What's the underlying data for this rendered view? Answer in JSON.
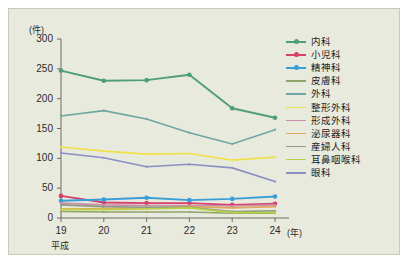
{
  "chart_data": {
    "type": "line",
    "title": "",
    "subtitle": "",
    "xlabel": "(年)",
    "ylabel": "(件)",
    "era_label": "平成",
    "x_unit": "(年)",
    "y_unit": "(件)",
    "categories": [
      "19",
      "20",
      "21",
      "22",
      "23",
      "24"
    ],
    "x": [
      19,
      20,
      21,
      22,
      23,
      24
    ],
    "xlim": [
      19,
      24
    ],
    "ylim": [
      0,
      300
    ],
    "yticks": [
      0,
      50,
      100,
      150,
      200,
      250,
      300
    ],
    "xticks": [
      "19",
      "20",
      "21",
      "22",
      "23",
      "24"
    ],
    "grid": false,
    "legend_position": "right",
    "markers": true,
    "series": [
      {
        "name": "内科",
        "color": "#4f9e78",
        "marker": true,
        "values": [
          247,
          230,
          231,
          240,
          184,
          168
        ]
      },
      {
        "name": "小児科",
        "color": "#d4426c",
        "marker": true,
        "values": [
          37,
          26,
          25,
          25,
          22,
          24
        ]
      },
      {
        "name": "精神科",
        "color": "#3a9ed6",
        "marker": true,
        "values": [
          29,
          31,
          34,
          30,
          32,
          36
        ]
      },
      {
        "name": "皮膚科",
        "color": "#92a36b",
        "marker": false,
        "values": [
          11,
          10,
          10,
          10,
          8,
          8
        ]
      },
      {
        "name": "外科",
        "color": "#6fa6a1",
        "marker": false,
        "values": [
          171,
          180,
          166,
          143,
          124,
          148
        ]
      },
      {
        "name": "整形外科",
        "color": "#f2e04a",
        "marker": false,
        "values": [
          119,
          112,
          107,
          108,
          97,
          102
        ]
      },
      {
        "name": "形成外科",
        "color": "#c78fa8",
        "marker": false,
        "values": [
          25,
          22,
          21,
          21,
          20,
          22
        ]
      },
      {
        "name": "泌尿器科",
        "color": "#e0a85c",
        "marker": false,
        "values": [
          15,
          16,
          17,
          19,
          17,
          19
        ]
      },
      {
        "name": "産婦人科",
        "color": "#8f9a86",
        "marker": false,
        "values": [
          22,
          19,
          18,
          18,
          11,
          12
        ]
      },
      {
        "name": "耳鼻咽喉科",
        "color": "#b7d34a",
        "marker": false,
        "values": [
          14,
          14,
          15,
          17,
          9,
          9
        ]
      },
      {
        "name": "眼科",
        "color": "#8b8fc4",
        "marker": false,
        "values": [
          109,
          101,
          86,
          90,
          84,
          61
        ]
      }
    ]
  },
  "legend": {
    "items": [
      {
        "label": "内科"
      },
      {
        "label": "小児科"
      },
      {
        "label": "精神科"
      },
      {
        "label": "皮膚科"
      },
      {
        "label": "外科"
      },
      {
        "label": "整形外科"
      },
      {
        "label": "形成外科"
      },
      {
        "label": "泌尿器科"
      },
      {
        "label": "産婦人科"
      },
      {
        "label": "耳鼻咽喉科"
      },
      {
        "label": "眼科"
      }
    ]
  },
  "axes": {
    "y_unit": "(件)",
    "x_unit": "(年)",
    "era": "平成",
    "yticks": [
      "300",
      "250",
      "200",
      "150",
      "100",
      "50",
      "0"
    ],
    "xticks": [
      "19",
      "20",
      "21",
      "22",
      "23",
      "24"
    ]
  }
}
